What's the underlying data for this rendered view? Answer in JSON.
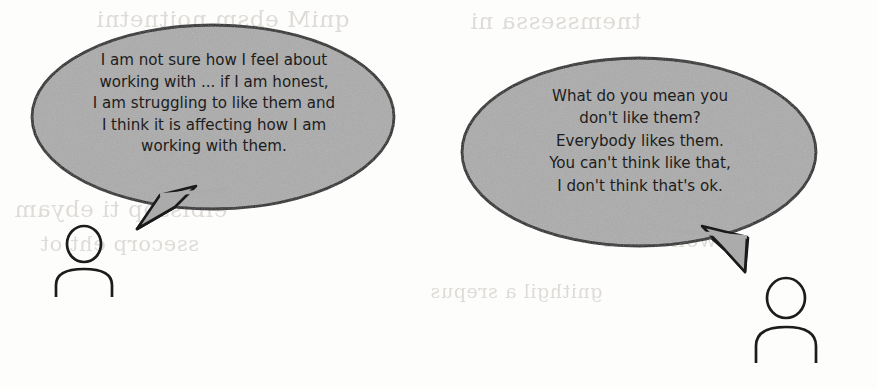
{
  "scene": {
    "title": "Two-person conversation illustration",
    "width": 877,
    "height": 388,
    "background_color": "#fdfdfc",
    "bubble_fill_color": "#ababab",
    "bubble_stroke_color": "#1a1a1a",
    "text_color": "#1c1c1c",
    "ghost_text_color": "#d9d6d2"
  },
  "speech_bubbles": [
    {
      "id": "left",
      "speaker": "person-left",
      "shape": "ellipse-with-tail",
      "tail_direction": "down-left",
      "text": "I am not sure how I feel about\nworking with ... if I am honest,\nI am struggling to like them and\nI think it is affecting how I am\nworking with them.",
      "lines": [
        "I am not sure how I feel about",
        "working with ... if I am honest,",
        "I am struggling to like them and",
        "I think it is affecting how I am",
        "working with them."
      ]
    },
    {
      "id": "right",
      "speaker": "person-right",
      "shape": "ellipse-with-tail",
      "tail_direction": "down-right",
      "text": "What do you mean you\ndon't like them?\nEverybody likes them.\nYou can't think like that,\nI don't think that's ok.",
      "lines": [
        "What do you mean you",
        "don't like them?",
        "Everybody likes them.",
        "You can't think like that,",
        "I don't think that's ok."
      ]
    }
  ],
  "people": [
    {
      "id": "person-left",
      "icon": "person-outline-icon",
      "position": "left"
    },
    {
      "id": "person-right",
      "icon": "person-outline-icon",
      "position": "right"
    }
  ],
  "ghost_text": {
    "note": "faint mirrored bleed-through from reverse of scanned page; illegible",
    "fragments": [
      "qniM ebsm noitnetni",
      "tnemssessa ni",
      "elbissop ti ebyam",
      "ssecorp eht ot",
      "eht dna",
      "swollof ehT",
      "gnithgil a srepus"
    ]
  }
}
